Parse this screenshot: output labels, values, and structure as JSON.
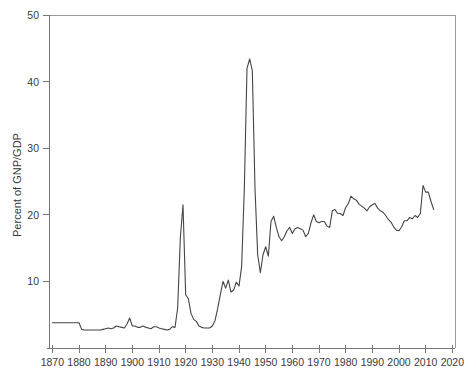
{
  "chart_data": {
    "type": "line",
    "title": "",
    "subtitle": "",
    "xlabel": "",
    "ylabel": "Percent of GNP/GDP",
    "xlim": [
      1868,
      2021
    ],
    "ylim": [
      0,
      50
    ],
    "grid": false,
    "legend": null,
    "xticks": [
      1870,
      1880,
      1890,
      1900,
      1910,
      1920,
      1930,
      1940,
      1950,
      1960,
      1970,
      1980,
      1990,
      2000,
      2010,
      2020
    ],
    "yticks": [
      0,
      10,
      20,
      30,
      40,
      50
    ],
    "xtick_labels": [
      "1870",
      "1880",
      "1890",
      "1900",
      "1910",
      "1920",
      "1930",
      "1940",
      "1950",
      "1960",
      "1970",
      "1980",
      "1990",
      "2000",
      "2010",
      "2020"
    ],
    "ytick_labels": [
      "",
      "10",
      "20",
      "30",
      "40",
      "50"
    ],
    "line_color": "#454545",
    "series": [
      {
        "name": "Federal spending as percent of GNP/GDP",
        "x": [
          1870,
          1871,
          1872,
          1873,
          1874,
          1875,
          1876,
          1877,
          1878,
          1879,
          1880,
          1881,
          1882,
          1883,
          1884,
          1885,
          1886,
          1887,
          1888,
          1889,
          1890,
          1891,
          1892,
          1893,
          1894,
          1895,
          1896,
          1897,
          1898,
          1899,
          1900,
          1901,
          1902,
          1903,
          1904,
          1905,
          1906,
          1907,
          1908,
          1909,
          1910,
          1911,
          1912,
          1913,
          1914,
          1915,
          1916,
          1917,
          1918,
          1919,
          1920,
          1921,
          1922,
          1923,
          1924,
          1925,
          1926,
          1927,
          1928,
          1929,
          1930,
          1931,
          1932,
          1933,
          1934,
          1935,
          1936,
          1937,
          1938,
          1939,
          1940,
          1941,
          1942,
          1943,
          1944,
          1945,
          1946,
          1947,
          1948,
          1949,
          1950,
          1951,
          1952,
          1953,
          1954,
          1955,
          1956,
          1957,
          1958,
          1959,
          1960,
          1961,
          1962,
          1963,
          1964,
          1965,
          1966,
          1967,
          1968,
          1969,
          1970,
          1971,
          1972,
          1973,
          1974,
          1975,
          1976,
          1977,
          1978,
          1979,
          1980,
          1981,
          1982,
          1983,
          1984,
          1985,
          1986,
          1987,
          1988,
          1989,
          1990,
          1991,
          1992,
          1993,
          1994,
          1995,
          1996,
          1997,
          1998,
          1999,
          2000,
          2001,
          2002,
          2003,
          2004,
          2005,
          2006,
          2007,
          2008,
          2009,
          2010,
          2011,
          2012,
          2013
        ],
        "values": [
          3.8,
          3.8,
          3.8,
          3.8,
          3.8,
          3.8,
          3.8,
          3.8,
          3.8,
          3.8,
          3.8,
          2.8,
          2.7,
          2.7,
          2.7,
          2.7,
          2.7,
          2.7,
          2.7,
          2.8,
          2.9,
          3.0,
          2.9,
          3.0,
          3.3,
          3.2,
          3.1,
          3.0,
          3.6,
          4.5,
          3.3,
          3.3,
          3.1,
          3.1,
          3.3,
          3.1,
          3.0,
          2.9,
          3.2,
          3.2,
          3.0,
          2.9,
          2.8,
          2.7,
          2.8,
          3.2,
          3.1,
          6.0,
          16.5,
          21.5,
          8.0,
          7.4,
          5.2,
          4.3,
          4.0,
          3.3,
          3.1,
          3.0,
          3.0,
          3.0,
          3.3,
          4.1,
          5.9,
          8.0,
          10.0,
          9.0,
          10.2,
          8.4,
          8.7,
          9.9,
          9.3,
          12.3,
          24.0,
          42.0,
          43.4,
          41.6,
          24.0,
          14.0,
          11.3,
          14.0,
          15.2,
          13.8,
          19.0,
          19.8,
          18.1,
          16.7,
          16.1,
          16.7,
          17.6,
          18.1,
          17.2,
          17.9,
          18.1,
          17.9,
          17.7,
          16.7,
          17.2,
          18.8,
          20.0,
          19.0,
          18.8,
          19.0,
          19.0,
          18.3,
          18.1,
          20.6,
          20.8,
          20.2,
          20.2,
          19.9,
          21.1,
          21.7,
          22.8,
          22.4,
          22.2,
          21.6,
          21.3,
          21.0,
          20.6,
          21.2,
          21.5,
          21.7,
          21.0,
          20.6,
          20.4,
          19.9,
          19.3,
          18.9,
          18.2,
          17.7,
          17.6,
          18.2,
          19.1,
          19.1,
          19.6,
          19.4,
          19.9,
          19.6,
          20.2,
          24.4,
          23.4,
          23.4,
          22.0,
          20.8
        ]
      }
    ]
  },
  "axis": {
    "y_title": "Percent of GNP/GDP"
  }
}
